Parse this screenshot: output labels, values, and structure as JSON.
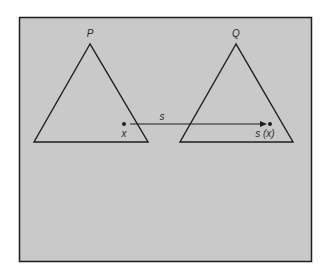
{
  "diagram": {
    "type": "mapping-between-triangles",
    "colors": {
      "background": "#ffffff",
      "panel": "#c9c9c9",
      "stroke": "#1e1e1e"
    },
    "triangles": [
      {
        "label": "P",
        "apex": [
          90,
          44
        ],
        "base_left": [
          34,
          142
        ],
        "base_right": [
          148,
          142
        ]
      },
      {
        "label": "Q",
        "apex": [
          236,
          44
        ],
        "base_left": [
          180,
          142
        ],
        "base_right": [
          293,
          142
        ]
      }
    ],
    "points": [
      {
        "label": "x",
        "at": [
          124,
          124
        ]
      },
      {
        "label": "s (x)",
        "at": [
          270,
          124
        ]
      }
    ],
    "arrow": {
      "label": "s",
      "from": [
        130,
        124
      ],
      "to": [
        267,
        124
      ]
    },
    "labels": {
      "P": "P",
      "Q": "Q",
      "x": "x",
      "s": "s",
      "sx": "s (x)"
    }
  }
}
